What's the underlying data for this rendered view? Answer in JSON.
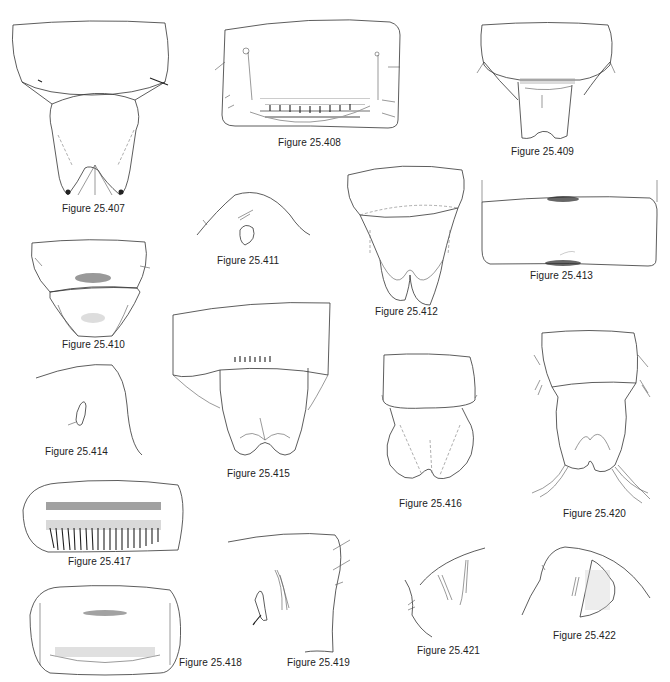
{
  "plate": {
    "figures": [
      {
        "id": "407",
        "caption": "Figure 25.407"
      },
      {
        "id": "408",
        "caption": "Figure 25.408"
      },
      {
        "id": "409",
        "caption": "Figure 25.409"
      },
      {
        "id": "410",
        "caption": "Figure 25.410"
      },
      {
        "id": "411",
        "caption": "Figure 25.411"
      },
      {
        "id": "412",
        "caption": "Figure 25.412"
      },
      {
        "id": "413",
        "caption": "Figure 25.413"
      },
      {
        "id": "414",
        "caption": "Figure 25.414"
      },
      {
        "id": "415",
        "caption": "Figure 25.415"
      },
      {
        "id": "416",
        "caption": "Figure 25.416"
      },
      {
        "id": "417",
        "caption": "Figure 25.417"
      },
      {
        "id": "418",
        "caption": "Figure 25.418"
      },
      {
        "id": "419",
        "caption": "Figure 25.419"
      },
      {
        "id": "420",
        "caption": "Figure 25.420"
      },
      {
        "id": "421",
        "caption": "Figure 25.421"
      },
      {
        "id": "422",
        "caption": "Figure 25.422"
      }
    ]
  }
}
